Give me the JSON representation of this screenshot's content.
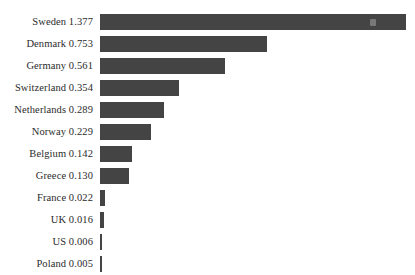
{
  "chart_data": {
    "type": "bar",
    "orientation": "horizontal",
    "title": "",
    "subtitle": "",
    "xlabel": "",
    "ylabel": "",
    "grid": false,
    "legend": null,
    "axis_line": false,
    "tick_labels": [],
    "xlim": [
      0,
      1.377
    ],
    "value_in_label": true,
    "bar_color": "#444444",
    "background_color": "#ffffff",
    "categories": [
      "Sweden",
      "Denmark",
      "Germany",
      "Switzerland",
      "Netherlands",
      "Norway",
      "Belgium",
      "Greece",
      "France",
      "UK",
      "US",
      "Poland"
    ],
    "values": [
      1.377,
      0.753,
      0.561,
      0.354,
      0.289,
      0.229,
      0.142,
      0.13,
      0.022,
      0.016,
      0.006,
      0.005
    ],
    "rows": [
      {
        "label": "Sweden 1.377",
        "name": "Sweden",
        "value": 1.377
      },
      {
        "label": "Denmark 0.753",
        "name": "Denmark",
        "value": 0.753
      },
      {
        "label": "Germany 0.561",
        "name": "Germany",
        "value": 0.561
      },
      {
        "label": "Switzerland 0.354",
        "name": "Switzerland",
        "value": 0.354
      },
      {
        "label": "Netherlands 0.289",
        "name": "Netherlands",
        "value": 0.289
      },
      {
        "label": "Norway 0.229",
        "name": "Norway",
        "value": 0.229
      },
      {
        "label": "Belgium 0.142",
        "name": "Belgium",
        "value": 0.142
      },
      {
        "label": "Greece 0.130",
        "name": "Greece",
        "value": 0.13
      },
      {
        "label": "France 0.022",
        "name": "France",
        "value": 0.022
      },
      {
        "label": "UK 0.016",
        "name": "UK",
        "value": 0.016
      },
      {
        "label": "US 0.006",
        "name": "US",
        "value": 0.006
      },
      {
        "label": "Poland 0.005",
        "name": "Poland",
        "value": 0.005
      }
    ]
  }
}
